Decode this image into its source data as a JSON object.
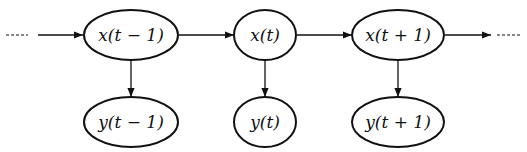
{
  "diagram": {
    "type": "hidden-markov-model",
    "hidden_states": [
      {
        "id": "x_prev",
        "label": "x(t − 1)"
      },
      {
        "id": "x_curr",
        "label": "x(t)"
      },
      {
        "id": "x_next",
        "label": "x(t + 1)"
      }
    ],
    "observations": [
      {
        "id": "y_prev",
        "label": "y(t − 1)"
      },
      {
        "id": "y_curr",
        "label": "y(t)"
      },
      {
        "id": "y_next",
        "label": "y(t + 1)"
      }
    ],
    "edges": [
      {
        "from": "start",
        "to": "x_prev"
      },
      {
        "from": "x_prev",
        "to": "x_curr"
      },
      {
        "from": "x_curr",
        "to": "x_next"
      },
      {
        "from": "x_next",
        "to": "end"
      },
      {
        "from": "x_prev",
        "to": "y_prev"
      },
      {
        "from": "x_curr",
        "to": "y_curr"
      },
      {
        "from": "x_next",
        "to": "y_next"
      }
    ],
    "continuation_left": "----",
    "continuation_right": "----"
  }
}
